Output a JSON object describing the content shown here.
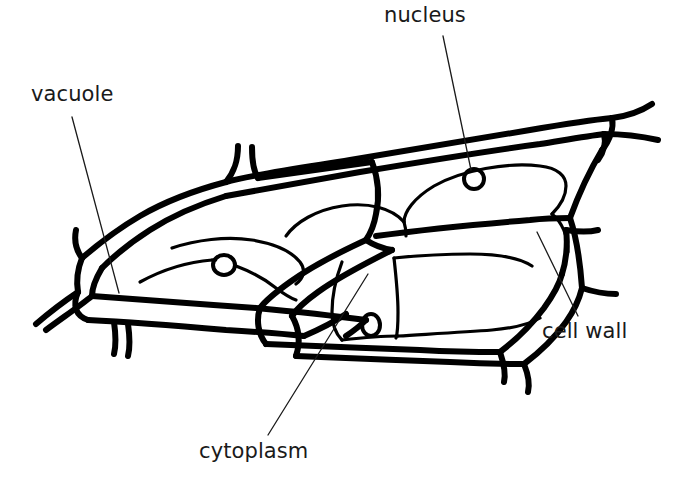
{
  "figure": {
    "kind": "plant-cell-diagram",
    "background_color": "#ffffff",
    "ink_color": "#000000",
    "label_color": "#1a1a1a",
    "wall_stroke_width": 6,
    "inner_stroke_width": 3.2,
    "leader_stroke_width": 1.3,
    "canvas": {
      "width": 680,
      "height": 487
    }
  },
  "labels": [
    {
      "id": "vacuole",
      "text": "vacuole",
      "x": 31,
      "y": 84,
      "leader": {
        "x1": 72,
        "y1": 117,
        "x2": 119,
        "y2": 293
      }
    },
    {
      "id": "nucleus",
      "text": "nucleus",
      "x": 384,
      "y": 5,
      "leader": {
        "x1": 443,
        "y1": 36,
        "x2": 471,
        "y2": 170
      }
    },
    {
      "id": "cytoplasm",
      "text": "cytoplasm",
      "x": 199,
      "y": 441,
      "leader": {
        "x1": 268,
        "y1": 435,
        "x2": 368,
        "y2": 274
      }
    },
    {
      "id": "cell-wall",
      "text": "cell wall",
      "x": 542,
      "y": 321,
      "leader": {
        "x1": 537,
        "y1": 232,
        "x2": 578,
        "y2": 316
      }
    }
  ],
  "nuclei": [
    {
      "id": "nucleus-left",
      "cx": 224,
      "cy": 265,
      "rx": 11,
      "ry": 10
    },
    {
      "id": "nucleus-top",
      "cx": 474,
      "cy": 179,
      "rx": 10,
      "ry": 10
    },
    {
      "id": "nucleus-bottom",
      "cx": 371,
      "cy": 325,
      "rx": 9,
      "ry": 11
    }
  ]
}
